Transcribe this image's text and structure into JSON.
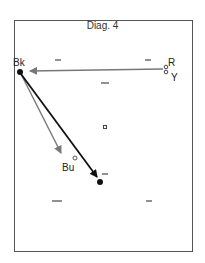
{
  "title": "Diag. 4",
  "labels": {
    "bk": "Bk",
    "r": "R",
    "y": "Y",
    "bu": "Bu"
  },
  "colors": {
    "black_arrow": "#111111",
    "grey_arrow": "#777777",
    "frame": "#555555"
  }
}
